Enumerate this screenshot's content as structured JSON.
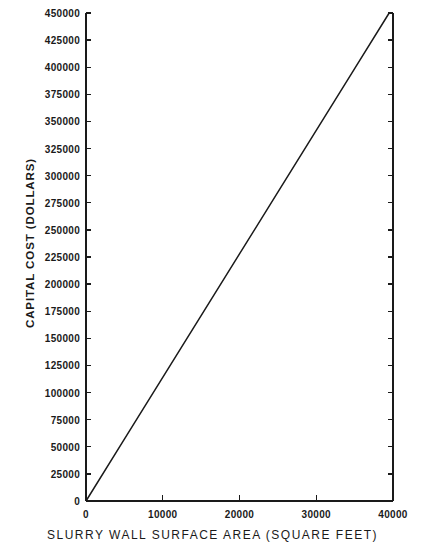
{
  "chart_data": {
    "type": "line",
    "title": "",
    "xlabel": "SLURRY WALL SURFACE AREA (SQUARE FEET)",
    "ylabel": "CAPITAL COST (DOLLARS)",
    "xlim": [
      0,
      40000
    ],
    "ylim": [
      0,
      450000
    ],
    "grid": false,
    "legend": "none",
    "xticks": [
      0,
      10000,
      20000,
      30000,
      40000
    ],
    "xtick_labels": [
      "0",
      "10000",
      "20000",
      "30000",
      "40000"
    ],
    "yticks": [
      0,
      25000,
      50000,
      75000,
      100000,
      125000,
      150000,
      175000,
      200000,
      225000,
      250000,
      275000,
      300000,
      325000,
      350000,
      375000,
      400000,
      425000,
      450000
    ],
    "ytick_labels": [
      "0",
      "25000",
      "50000",
      "75000",
      "100000",
      "125000",
      "150000",
      "175000",
      "200000",
      "225000",
      "250000",
      "275000",
      "300000",
      "325000",
      "350000",
      "375000",
      "400000",
      "425000",
      "450000"
    ],
    "series": [
      {
        "name": "Capital cost vs slurry wall surface area",
        "color": "#1a1a1a",
        "x": [
          0,
          5000,
          10000,
          15000,
          20000,
          25000,
          30000,
          35000,
          39500
        ],
        "values": [
          0,
          56962,
          113924,
          170886,
          227848,
          284810,
          341772,
          398734,
          450000
        ]
      }
    ],
    "annotations": []
  },
  "axes": {
    "line_color": "#1a1a1a",
    "tick_direction": "in",
    "spines": [
      "left",
      "right",
      "bottom"
    ]
  }
}
